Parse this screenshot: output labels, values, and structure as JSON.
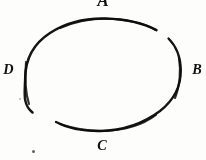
{
  "figure": {
    "kind": "ellipse-orbit-diagram",
    "background_color": "#fdfdfc",
    "ink_color": "#101010",
    "labels": {
      "top": "A",
      "right": "B",
      "bottom": "C",
      "left": "D"
    },
    "ellipse": {
      "center_x": 103,
      "center_y": 76,
      "radius_x": 78,
      "radius_y": 55,
      "stroke_width": 2.2
    },
    "arcs": [
      {
        "name": "arc-top-left-to-A",
        "start_angle_deg": 180,
        "end_angle_deg": 340
      },
      {
        "name": "arc-B-to-bottom",
        "start_angle_deg": 352,
        "end_angle_deg": 150
      }
    ],
    "gaps": [
      {
        "name": "gap-upper-right",
        "approx_angle_deg": 346
      },
      {
        "name": "gap-lower-left",
        "approx_angle_deg": 163
      }
    ],
    "marks": {
      "speck": "ink-speck",
      "faint_dot": "faint-ink-dot"
    }
  }
}
